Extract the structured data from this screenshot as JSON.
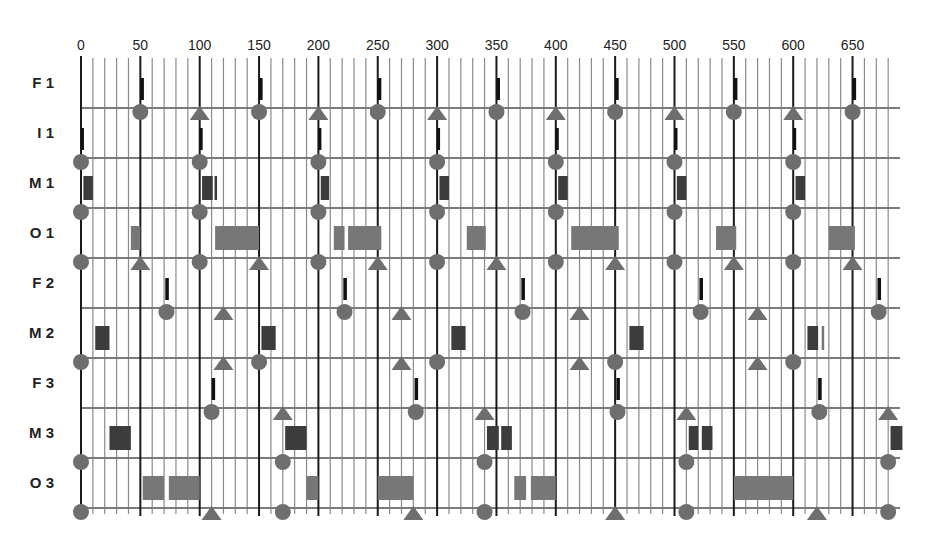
{
  "chart_data": {
    "type": "timing-diagram",
    "title": "",
    "x_axis": {
      "min": 0,
      "max": 690,
      "major_step": 50,
      "minor_step": 10,
      "tick_labels": [
        "0",
        "50",
        "100",
        "150",
        "200",
        "250",
        "300",
        "350",
        "400",
        "450",
        "500",
        "550",
        "600",
        "650"
      ],
      "position": "top"
    },
    "grid": true,
    "colors": {
      "grid_minor": "#8a8a8a",
      "grid_major": "#1a1a1a",
      "row_line": "#7a7a7a",
      "marker": "#6e6e6e",
      "bar_dark": "#3c3c3c",
      "bar_light": "#777777",
      "bar_black": "#111111"
    },
    "rows": [
      {
        "label": "F 1",
        "bars": [
          {
            "start": 50,
            "end": 53,
            "style": "black"
          },
          {
            "start": 150,
            "end": 153,
            "style": "black"
          },
          {
            "start": 250,
            "end": 253,
            "style": "black"
          },
          {
            "start": 350,
            "end": 353,
            "style": "black"
          },
          {
            "start": 450,
            "end": 453,
            "style": "black"
          },
          {
            "start": 550,
            "end": 553,
            "style": "black"
          },
          {
            "start": 650,
            "end": 653,
            "style": "black"
          }
        ],
        "markers": [
          {
            "t": 50,
            "shape": "circle"
          },
          {
            "t": 100,
            "shape": "triangle"
          },
          {
            "t": 150,
            "shape": "circle"
          },
          {
            "t": 200,
            "shape": "triangle"
          },
          {
            "t": 250,
            "shape": "circle"
          },
          {
            "t": 300,
            "shape": "triangle"
          },
          {
            "t": 350,
            "shape": "circle"
          },
          {
            "t": 400,
            "shape": "triangle"
          },
          {
            "t": 450,
            "shape": "circle"
          },
          {
            "t": 500,
            "shape": "triangle"
          },
          {
            "t": 550,
            "shape": "circle"
          },
          {
            "t": 600,
            "shape": "triangle"
          },
          {
            "t": 650,
            "shape": "circle"
          }
        ]
      },
      {
        "label": "I 1",
        "bars": [
          {
            "start": 0,
            "end": 2.5,
            "style": "black"
          },
          {
            "start": 100,
            "end": 102.5,
            "style": "black"
          },
          {
            "start": 200,
            "end": 202.5,
            "style": "black"
          },
          {
            "start": 300,
            "end": 302.5,
            "style": "black"
          },
          {
            "start": 400,
            "end": 402.5,
            "style": "black"
          },
          {
            "start": 500,
            "end": 502.5,
            "style": "black"
          },
          {
            "start": 600,
            "end": 602.5,
            "style": "black"
          }
        ],
        "markers": [
          {
            "t": 0,
            "shape": "circle"
          },
          {
            "t": 100,
            "shape": "circle"
          },
          {
            "t": 200,
            "shape": "circle"
          },
          {
            "t": 300,
            "shape": "circle"
          },
          {
            "t": 400,
            "shape": "circle"
          },
          {
            "t": 500,
            "shape": "circle"
          },
          {
            "t": 600,
            "shape": "circle"
          }
        ]
      },
      {
        "label": "M 1",
        "bars": [
          {
            "start": 2,
            "end": 10,
            "style": "dark"
          },
          {
            "start": 102,
            "end": 111,
            "style": "dark"
          },
          {
            "start": 112.5,
            "end": 114,
            "style": "dark"
          },
          {
            "start": 202,
            "end": 209,
            "style": "dark"
          },
          {
            "start": 302,
            "end": 310,
            "style": "dark"
          },
          {
            "start": 402,
            "end": 410,
            "style": "dark"
          },
          {
            "start": 502,
            "end": 510,
            "style": "dark"
          },
          {
            "start": 602,
            "end": 610,
            "style": "dark"
          }
        ],
        "markers": [
          {
            "t": 0,
            "shape": "circle"
          },
          {
            "t": 100,
            "shape": "circle"
          },
          {
            "t": 200,
            "shape": "circle"
          },
          {
            "t": 300,
            "shape": "circle"
          },
          {
            "t": 400,
            "shape": "circle"
          },
          {
            "t": 500,
            "shape": "circle"
          },
          {
            "t": 600,
            "shape": "circle"
          }
        ]
      },
      {
        "label": "O 1",
        "bars": [
          {
            "start": 42,
            "end": 50,
            "style": "light"
          },
          {
            "start": 113,
            "end": 150,
            "style": "light"
          },
          {
            "start": 213,
            "end": 222,
            "style": "light"
          },
          {
            "start": 225,
            "end": 253,
            "style": "light"
          },
          {
            "start": 325,
            "end": 341,
            "style": "light"
          },
          {
            "start": 413,
            "end": 453,
            "style": "light"
          },
          {
            "start": 535,
            "end": 552,
            "style": "light"
          },
          {
            "start": 630,
            "end": 652,
            "style": "light"
          }
        ],
        "markers": [
          {
            "t": 0,
            "shape": "circle"
          },
          {
            "t": 50,
            "shape": "triangle"
          },
          {
            "t": 100,
            "shape": "circle"
          },
          {
            "t": 150,
            "shape": "triangle"
          },
          {
            "t": 200,
            "shape": "circle"
          },
          {
            "t": 250,
            "shape": "triangle"
          },
          {
            "t": 300,
            "shape": "circle"
          },
          {
            "t": 350,
            "shape": "triangle"
          },
          {
            "t": 400,
            "shape": "circle"
          },
          {
            "t": 450,
            "shape": "triangle"
          },
          {
            "t": 500,
            "shape": "circle"
          },
          {
            "t": 550,
            "shape": "triangle"
          },
          {
            "t": 600,
            "shape": "circle"
          },
          {
            "t": 650,
            "shape": "triangle"
          }
        ]
      },
      {
        "label": "F 2",
        "bars": [
          {
            "start": 71,
            "end": 74,
            "style": "black"
          },
          {
            "start": 221,
            "end": 224,
            "style": "black"
          },
          {
            "start": 371,
            "end": 374,
            "style": "black"
          },
          {
            "start": 521,
            "end": 524,
            "style": "black"
          },
          {
            "start": 671,
            "end": 674,
            "style": "black"
          }
        ],
        "markers": [
          {
            "t": 72,
            "shape": "circle"
          },
          {
            "t": 120,
            "shape": "triangle"
          },
          {
            "t": 222,
            "shape": "circle"
          },
          {
            "t": 270,
            "shape": "triangle"
          },
          {
            "t": 372,
            "shape": "circle"
          },
          {
            "t": 420,
            "shape": "triangle"
          },
          {
            "t": 522,
            "shape": "circle"
          },
          {
            "t": 570,
            "shape": "triangle"
          },
          {
            "t": 672,
            "shape": "circle"
          }
        ]
      },
      {
        "label": "M 2",
        "bars": [
          {
            "start": 12,
            "end": 24,
            "style": "dark"
          },
          {
            "start": 152,
            "end": 164,
            "style": "dark"
          },
          {
            "start": 312,
            "end": 324,
            "style": "dark"
          },
          {
            "start": 462,
            "end": 474,
            "style": "dark"
          },
          {
            "start": 612,
            "end": 621,
            "style": "dark"
          },
          {
            "start": 624,
            "end": 626,
            "style": "light"
          }
        ],
        "markers": [
          {
            "t": 0,
            "shape": "circle"
          },
          {
            "t": 120,
            "shape": "triangle"
          },
          {
            "t": 150,
            "shape": "circle"
          },
          {
            "t": 270,
            "shape": "triangle"
          },
          {
            "t": 300,
            "shape": "circle"
          },
          {
            "t": 420,
            "shape": "triangle"
          },
          {
            "t": 450,
            "shape": "circle"
          },
          {
            "t": 570,
            "shape": "triangle"
          },
          {
            "t": 600,
            "shape": "circle"
          }
        ]
      },
      {
        "label": "F 3",
        "bars": [
          {
            "start": 110,
            "end": 113,
            "style": "black"
          },
          {
            "start": 281,
            "end": 284,
            "style": "black"
          },
          {
            "start": 451,
            "end": 454,
            "style": "black"
          },
          {
            "start": 621,
            "end": 624,
            "style": "black"
          }
        ],
        "markers": [
          {
            "t": 110,
            "shape": "circle"
          },
          {
            "t": 170,
            "shape": "triangle"
          },
          {
            "t": 282,
            "shape": "circle"
          },
          {
            "t": 340,
            "shape": "triangle"
          },
          {
            "t": 452,
            "shape": "circle"
          },
          {
            "t": 510,
            "shape": "triangle"
          },
          {
            "t": 622,
            "shape": "circle"
          },
          {
            "t": 680,
            "shape": "triangle"
          }
        ]
      },
      {
        "label": "M 3",
        "bars": [
          {
            "start": 24,
            "end": 42,
            "style": "dark"
          },
          {
            "start": 172,
            "end": 190,
            "style": "dark"
          },
          {
            "start": 342,
            "end": 352,
            "style": "dark"
          },
          {
            "start": 354,
            "end": 363,
            "style": "dark"
          },
          {
            "start": 512,
            "end": 520,
            "style": "dark"
          },
          {
            "start": 523,
            "end": 532,
            "style": "dark"
          },
          {
            "start": 682,
            "end": 692,
            "style": "dark"
          }
        ],
        "markers": [
          {
            "t": 0,
            "shape": "circle"
          },
          {
            "t": 170,
            "shape": "circle"
          },
          {
            "t": 340,
            "shape": "circle"
          },
          {
            "t": 510,
            "shape": "circle"
          },
          {
            "t": 680,
            "shape": "circle"
          }
        ]
      },
      {
        "label": "O 3",
        "bars": [
          {
            "start": 52,
            "end": 70,
            "style": "light"
          },
          {
            "start": 74,
            "end": 100,
            "style": "light"
          },
          {
            "start": 190,
            "end": 200,
            "style": "light"
          },
          {
            "start": 250,
            "end": 280,
            "style": "light"
          },
          {
            "start": 365,
            "end": 375,
            "style": "light"
          },
          {
            "start": 379,
            "end": 400,
            "style": "light"
          },
          {
            "start": 550,
            "end": 600,
            "style": "light"
          }
        ],
        "markers": [
          {
            "t": 0,
            "shape": "circle"
          },
          {
            "t": 110,
            "shape": "triangle"
          },
          {
            "t": 170,
            "shape": "circle"
          },
          {
            "t": 280,
            "shape": "triangle"
          },
          {
            "t": 340,
            "shape": "circle"
          },
          {
            "t": 450,
            "shape": "triangle"
          },
          {
            "t": 510,
            "shape": "circle"
          },
          {
            "t": 620,
            "shape": "triangle"
          },
          {
            "t": 680,
            "shape": "circle"
          }
        ]
      }
    ]
  }
}
